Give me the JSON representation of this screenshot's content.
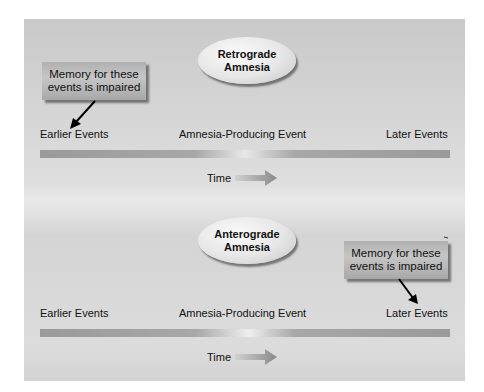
{
  "retrograde": {
    "title_line1": "Retrograde",
    "title_line2": "Amnesia",
    "callout_line1": "Memory for these",
    "callout_line2": "events is impaired",
    "callout_target": "Earlier Events",
    "timeline": {
      "left_label": "Earlier Events",
      "center_label": "Amnesia-Producing Event",
      "right_label": "Later Events"
    },
    "time_label": "Time",
    "arrow_icon": "right-arrow-icon"
  },
  "anterograde": {
    "title_line1": "Anterograde",
    "title_line2": "Amnesia",
    "callout_line1": "Memory for these",
    "callout_line2": "events is impaired",
    "callout_target": "Later Events",
    "timeline": {
      "left_label": "Earlier Events",
      "center_label": "Amnesia-Producing Event",
      "right_label": "Later Events"
    },
    "time_label": "Time",
    "arrow_icon": "right-arrow-icon"
  },
  "colors": {
    "panel_bg": "#d8d8d8",
    "bar": "#9a9a9a",
    "bar_highlight": "#f0f0f0",
    "text": "#111111"
  }
}
